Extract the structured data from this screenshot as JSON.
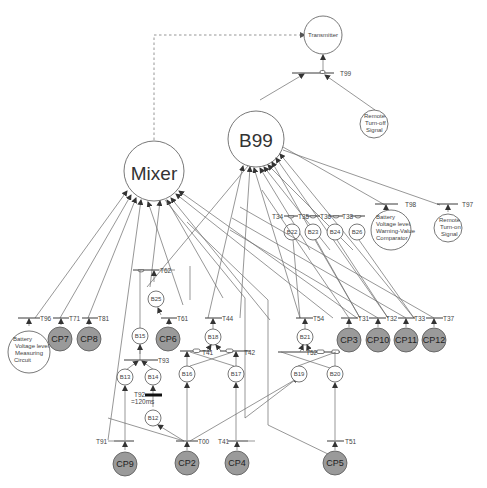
{
  "diagram": {
    "type": "petri-net",
    "places": {
      "transmitter": "Transmitter",
      "mixer": "Mixer",
      "b99": "B99",
      "remote_turn_off": [
        "Remote",
        "Turn-off",
        "Signal"
      ],
      "remote_turn_on": [
        "Remote",
        "Turn-on",
        "Signal"
      ],
      "comparator": [
        "Battery",
        "Voltage level",
        "Warning-Value",
        "Comparator"
      ],
      "measuring": [
        "Battery",
        "Voltage level",
        "Measuring",
        "Circuit"
      ],
      "b12": "B12",
      "b13": "B13",
      "b14": "B14",
      "b15": "B15",
      "b16": "B16",
      "b17": "B17",
      "b18": "B18",
      "b19": "B19",
      "b20": "B20",
      "b21": "B21",
      "b22": "B22",
      "b23": "B23",
      "b24": "B24",
      "b25": "B25",
      "b26": "B26"
    },
    "control_places": {
      "cp2": "CP2",
      "cp3": "CP3",
      "cp4": "CP4",
      "cp5": "CP5",
      "cp6": "CP6",
      "cp7": "CP7",
      "cp8": "CP8",
      "cp9": "CP9",
      "cp10": "CP10",
      "cp11": "CP11",
      "cp12": "CP12"
    },
    "transitions": {
      "t99": "T99",
      "t96": "T96",
      "t97": "T97",
      "t98": "T98",
      "t71": "T71",
      "t81": "T81",
      "t62": "T62",
      "t61": "T61",
      "t44": "T44",
      "t41a": "T41",
      "t42": "T42",
      "t93": "T93",
      "t92": "T92",
      "t92_delay": "=120ms",
      "t91": "T91",
      "t00": "T00",
      "t41": "T41",
      "t51": "T51",
      "t52": "T52",
      "t54": "T54",
      "t31": "T31",
      "t32": "T32",
      "t33": "T33",
      "t37": "T37",
      "t34": "T34",
      "t35": "T35",
      "t36": "T36",
      "t38": "T38"
    },
    "colors": {
      "control_place_fill": "#9a9a9a",
      "line": "#6a6a6a",
      "background": "#ffffff"
    }
  }
}
